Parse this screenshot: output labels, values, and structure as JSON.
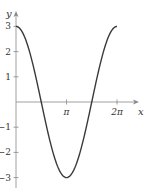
{
  "chart_data": {
    "type": "line",
    "title": "",
    "function": "y = 3cos(x)",
    "xlabel": "x",
    "ylabel": "y",
    "xlim": [
      0,
      6.2832
    ],
    "ylim": [
      -3,
      3
    ],
    "grid": false,
    "legend": null,
    "x_ticks": [
      {
        "value": 3.1416,
        "label": "π"
      },
      {
        "value": 6.2832,
        "label": "2π"
      }
    ],
    "y_ticks": [
      {
        "value": 3,
        "label": "3"
      },
      {
        "value": 2,
        "label": "2"
      },
      {
        "value": 1,
        "label": "1"
      },
      {
        "value": -1,
        "label": "−1"
      },
      {
        "value": -2,
        "label": "−2"
      },
      {
        "value": -3,
        "label": "−3"
      }
    ],
    "series": [
      {
        "name": "3cos(x)",
        "x": [
          0,
          0.7854,
          1.5708,
          2.3562,
          3.1416,
          3.927,
          4.7124,
          5.4978,
          6.2832
        ],
        "values": [
          3,
          2.12,
          0,
          -2.12,
          -3,
          -2.12,
          0,
          2.12,
          3
        ]
      }
    ],
    "colors": {
      "curve": "#3a3a3a",
      "axes": "#777777"
    }
  }
}
